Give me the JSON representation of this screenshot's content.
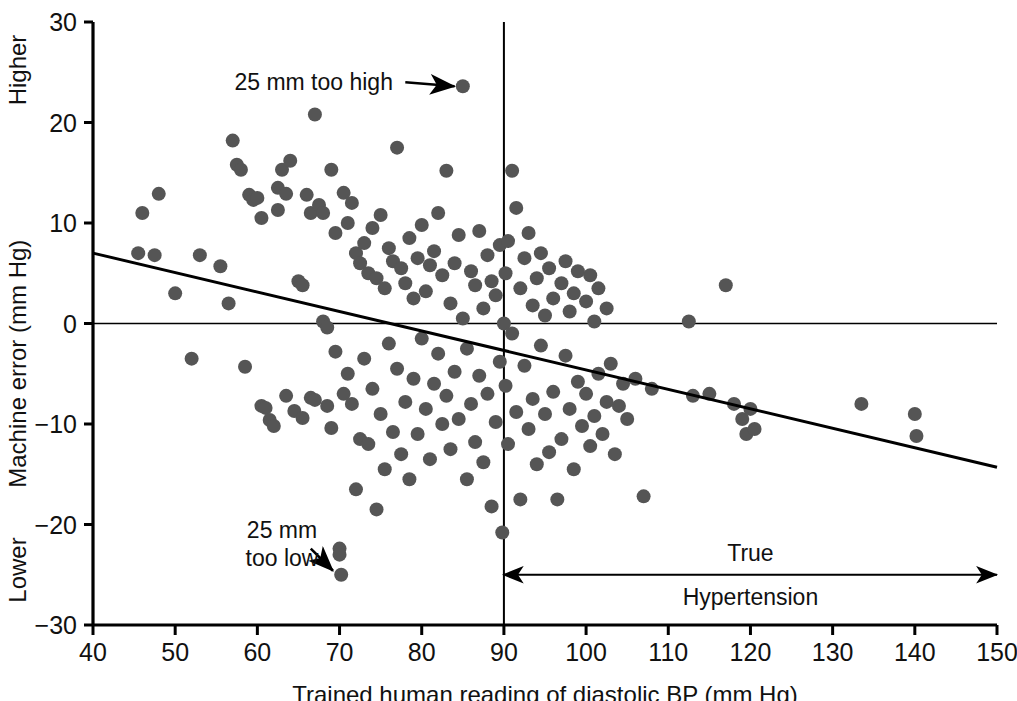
{
  "chart_data": {
    "type": "scatter",
    "title": "",
    "xlabel": "Trained human reading of diastolic BP (mm Hg)",
    "ylabel": "Machine error (mm Hg)",
    "xlim": [
      40,
      150
    ],
    "ylim": [
      -30,
      30
    ],
    "xticks": [
      40,
      50,
      60,
      70,
      80,
      90,
      100,
      110,
      120,
      130,
      140,
      150
    ],
    "yticks": [
      -30,
      -20,
      -10,
      0,
      10,
      20,
      30
    ],
    "grid": false,
    "legend": "none",
    "axis_end_labels": {
      "y_top": "Higher",
      "y_bottom": "Lower"
    },
    "marker": {
      "shape": "circle",
      "color": "#555555",
      "diameter_px": 14
    },
    "zero_line": {
      "y": 0,
      "color": "#000000",
      "width": 1.5
    },
    "reference_line": {
      "name": "true-hypertension-threshold",
      "x": 90,
      "color": "#000000",
      "width": 2
    },
    "regression_line": {
      "name": "trend-line",
      "x0": 40,
      "y0": 7.0,
      "x1": 150,
      "y1": -14.3,
      "color": "#000000",
      "width": 3
    },
    "annotations": [
      {
        "name": "too-high-annotation",
        "text": [
          "25 mm too high"
        ],
        "text_x": 76.5,
        "text_y": 24.0,
        "arrow_from_x": 78.0,
        "arrow_from_y": 24.0,
        "arrow_to_x": 84.0,
        "arrow_to_y": 23.6,
        "double_headed": false
      },
      {
        "name": "too-low-annotation",
        "text": [
          "25 mm",
          "too low"
        ],
        "text_x": 63.0,
        "text_y": -20.5,
        "arrow_from_x": 66.5,
        "arrow_from_y": -22.4,
        "arrow_to_x": 69.2,
        "arrow_to_y": -24.6,
        "double_headed": false
      },
      {
        "name": "true-hypertension-annotation",
        "text": [
          "True",
          "Hypertension"
        ],
        "text_x": 120.0,
        "text_y": -25.0,
        "arrow_from_x": 90.0,
        "arrow_from_y": -25.0,
        "arrow_to_x": 150.0,
        "arrow_to_y": -25.0,
        "double_headed": true
      }
    ],
    "points": [
      [
        45.5,
        7.0
      ],
      [
        46.0,
        11.0
      ],
      [
        47.5,
        6.8
      ],
      [
        48.0,
        12.9
      ],
      [
        50.0,
        3.0
      ],
      [
        52.0,
        -3.5
      ],
      [
        53.0,
        6.8
      ],
      [
        55.5,
        5.7
      ],
      [
        56.5,
        2.0
      ],
      [
        57.0,
        18.2
      ],
      [
        57.5,
        15.8
      ],
      [
        58.0,
        15.3
      ],
      [
        58.5,
        -4.3
      ],
      [
        59.0,
        12.8
      ],
      [
        59.5,
        12.3
      ],
      [
        60.0,
        12.5
      ],
      [
        60.5,
        10.5
      ],
      [
        60.5,
        -8.2
      ],
      [
        61.0,
        -8.4
      ],
      [
        61.5,
        -9.6
      ],
      [
        62.0,
        -10.2
      ],
      [
        62.5,
        13.5
      ],
      [
        62.5,
        11.3
      ],
      [
        63.0,
        15.3
      ],
      [
        63.5,
        12.9
      ],
      [
        63.5,
        -7.2
      ],
      [
        64.0,
        16.2
      ],
      [
        64.5,
        -8.7
      ],
      [
        65.0,
        4.2
      ],
      [
        65.5,
        3.8
      ],
      [
        65.5,
        -9.4
      ],
      [
        66.0,
        12.8
      ],
      [
        66.5,
        11.0
      ],
      [
        66.5,
        -7.4
      ],
      [
        67.0,
        20.8
      ],
      [
        67.0,
        -7.6
      ],
      [
        67.5,
        11.8
      ],
      [
        68.0,
        11.0
      ],
      [
        68.0,
        0.2
      ],
      [
        68.5,
        -0.4
      ],
      [
        68.5,
        -8.2
      ],
      [
        69.0,
        15.3
      ],
      [
        69.0,
        -10.4
      ],
      [
        69.5,
        9.0
      ],
      [
        69.5,
        -2.8
      ],
      [
        70.0,
        -22.4
      ],
      [
        70.0,
        -23.0
      ],
      [
        70.2,
        -25.0
      ],
      [
        70.5,
        13.0
      ],
      [
        70.5,
        -7.0
      ],
      [
        71.0,
        10.0
      ],
      [
        71.0,
        -5.0
      ],
      [
        71.5,
        12.0
      ],
      [
        71.5,
        -8.0
      ],
      [
        72.0,
        7.0
      ],
      [
        72.0,
        -16.5
      ],
      [
        72.5,
        6.0
      ],
      [
        72.5,
        -11.5
      ],
      [
        73.0,
        8.0
      ],
      [
        73.0,
        -3.5
      ],
      [
        73.5,
        5.0
      ],
      [
        73.5,
        -12.0
      ],
      [
        74.0,
        9.5
      ],
      [
        74.0,
        -6.5
      ],
      [
        74.5,
        4.5
      ],
      [
        74.5,
        -18.5
      ],
      [
        75.0,
        10.8
      ],
      [
        75.0,
        -9.0
      ],
      [
        75.5,
        3.5
      ],
      [
        75.5,
        -14.5
      ],
      [
        76.0,
        7.5
      ],
      [
        76.0,
        -2.0
      ],
      [
        76.5,
        6.2
      ],
      [
        76.5,
        -10.8
      ],
      [
        77.0,
        17.5
      ],
      [
        77.0,
        -4.5
      ],
      [
        77.5,
        5.5
      ],
      [
        77.5,
        -13.0
      ],
      [
        78.0,
        4.0
      ],
      [
        78.0,
        -7.8
      ],
      [
        78.5,
        8.5
      ],
      [
        78.5,
        -15.5
      ],
      [
        79.0,
        2.5
      ],
      [
        79.0,
        -5.5
      ],
      [
        79.5,
        6.5
      ],
      [
        79.5,
        -11.0
      ],
      [
        80.0,
        9.8
      ],
      [
        80.0,
        -1.5
      ],
      [
        80.5,
        3.2
      ],
      [
        80.5,
        -8.5
      ],
      [
        81.0,
        5.8
      ],
      [
        81.0,
        -13.5
      ],
      [
        81.5,
        7.2
      ],
      [
        81.5,
        -6.0
      ],
      [
        82.0,
        11.0
      ],
      [
        82.0,
        -3.0
      ],
      [
        82.5,
        4.8
      ],
      [
        82.5,
        -10.0
      ],
      [
        83.0,
        15.2
      ],
      [
        83.0,
        -7.2
      ],
      [
        83.5,
        2.0
      ],
      [
        83.5,
        -12.5
      ],
      [
        84.0,
        6.0
      ],
      [
        84.0,
        -4.8
      ],
      [
        84.5,
        8.8
      ],
      [
        84.5,
        -9.5
      ],
      [
        85.0,
        23.6
      ],
      [
        85.0,
        0.5
      ],
      [
        85.5,
        -2.5
      ],
      [
        85.5,
        -15.5
      ],
      [
        86.0,
        5.2
      ],
      [
        86.0,
        -8.0
      ],
      [
        86.5,
        3.8
      ],
      [
        86.5,
        -11.8
      ],
      [
        87.0,
        9.2
      ],
      [
        87.0,
        -5.2
      ],
      [
        87.5,
        1.5
      ],
      [
        87.5,
        -13.8
      ],
      [
        88.0,
        6.8
      ],
      [
        88.0,
        -7.0
      ],
      [
        88.5,
        4.2
      ],
      [
        88.5,
        -18.2
      ],
      [
        89.0,
        2.8
      ],
      [
        89.0,
        -9.8
      ],
      [
        89.5,
        7.8
      ],
      [
        89.5,
        -3.8
      ],
      [
        89.8,
        -20.8
      ],
      [
        90.0,
        0.0
      ],
      [
        90.2,
        5.0
      ],
      [
        90.2,
        -6.2
      ],
      [
        90.5,
        8.2
      ],
      [
        90.5,
        -12.0
      ],
      [
        91.0,
        15.2
      ],
      [
        91.0,
        -1.0
      ],
      [
        91.5,
        11.5
      ],
      [
        91.5,
        -8.8
      ],
      [
        92.0,
        3.5
      ],
      [
        92.0,
        -17.5
      ],
      [
        92.5,
        6.5
      ],
      [
        92.5,
        -4.2
      ],
      [
        93.0,
        9.0
      ],
      [
        93.0,
        -10.5
      ],
      [
        93.5,
        1.8
      ],
      [
        93.5,
        -7.5
      ],
      [
        94.0,
        4.5
      ],
      [
        94.0,
        -14.0
      ],
      [
        94.5,
        7.0
      ],
      [
        94.5,
        -2.2
      ],
      [
        95.0,
        0.8
      ],
      [
        95.0,
        -9.0
      ],
      [
        95.5,
        5.5
      ],
      [
        95.5,
        -12.8
      ],
      [
        96.0,
        2.5
      ],
      [
        96.0,
        -6.8
      ],
      [
        96.5,
        -17.5
      ],
      [
        97.0,
        4.0
      ],
      [
        97.0,
        -11.5
      ],
      [
        97.5,
        6.2
      ],
      [
        97.5,
        -3.2
      ],
      [
        98.0,
        1.2
      ],
      [
        98.0,
        -8.5
      ],
      [
        98.5,
        3.0
      ],
      [
        98.5,
        -14.5
      ],
      [
        99.0,
        5.2
      ],
      [
        99.0,
        -5.8
      ],
      [
        99.5,
        -10.2
      ],
      [
        100.0,
        2.2
      ],
      [
        100.0,
        -7.0
      ],
      [
        100.5,
        4.8
      ],
      [
        100.5,
        -12.2
      ],
      [
        101.0,
        0.2
      ],
      [
        101.0,
        -9.2
      ],
      [
        101.5,
        3.5
      ],
      [
        101.5,
        -5.0
      ],
      [
        102.0,
        -11.0
      ],
      [
        102.5,
        1.5
      ],
      [
        102.5,
        -7.8
      ],
      [
        103.0,
        -4.0
      ],
      [
        103.5,
        -13.0
      ],
      [
        104.0,
        -8.2
      ],
      [
        104.5,
        -6.0
      ],
      [
        105.0,
        -9.5
      ],
      [
        106.0,
        -5.5
      ],
      [
        107.0,
        -17.2
      ],
      [
        108.0,
        -6.5
      ],
      [
        112.5,
        0.2
      ],
      [
        113.0,
        -7.2
      ],
      [
        115.0,
        -7.0
      ],
      [
        117.0,
        3.8
      ],
      [
        118.0,
        -8.0
      ],
      [
        119.0,
        -9.5
      ],
      [
        119.5,
        -11.0
      ],
      [
        120.0,
        -8.5
      ],
      [
        120.5,
        -10.5
      ],
      [
        133.5,
        -8.0
      ],
      [
        140.0,
        -9.0
      ],
      [
        140.2,
        -11.2
      ]
    ]
  }
}
